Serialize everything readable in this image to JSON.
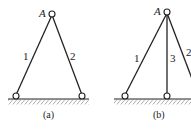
{
  "figures": [
    {
      "id": "a",
      "caption": "(a)",
      "apex_label": "A",
      "members": [
        {
          "label": "1"
        },
        {
          "label": "2"
        }
      ]
    },
    {
      "id": "b",
      "caption": "(b)",
      "apex_label": "A",
      "members": [
        {
          "label": "1"
        },
        {
          "label": "3"
        },
        {
          "label": "2"
        }
      ]
    }
  ],
  "colors": {
    "line": "#222222",
    "background": "#ffffff"
  }
}
